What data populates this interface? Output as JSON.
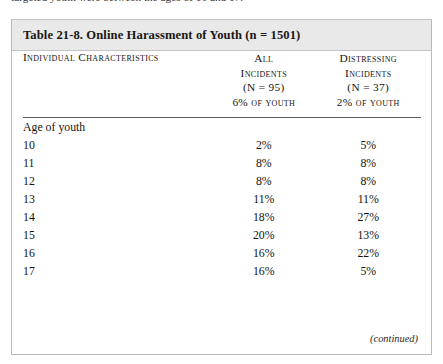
{
  "page": {
    "running_text_tail": "targeted youth were between the ages of 10 and 17."
  },
  "table": {
    "caption": "Table 21-8. Online Harassment of Youth (n = 1501)",
    "footer_note": "(continued)",
    "columns": [
      {
        "key": "characteristics",
        "header_lines": [
          "Individual Characteristics"
        ],
        "align": "left"
      },
      {
        "key": "all_incidents",
        "header_lines": [
          "All",
          "Incidents",
          "(N = 95)"
        ],
        "header_pct_lead": "6%",
        "header_pct_rest": " of youth",
        "align": "center"
      },
      {
        "key": "distressing_incidents",
        "header_lines": [
          "Distressing",
          "Incidents",
          "(N = 37)"
        ],
        "header_pct_lead": "2%",
        "header_pct_rest": " of youth",
        "align": "center"
      }
    ],
    "groups": [
      {
        "label": "Age of youth",
        "rows": [
          {
            "label": "10",
            "all_incidents": "2%",
            "distressing_incidents": "5%"
          },
          {
            "label": "11",
            "all_incidents": "8%",
            "distressing_incidents": "8%"
          },
          {
            "label": "12",
            "all_incidents": "8%",
            "distressing_incidents": "8%"
          },
          {
            "label": "13",
            "all_incidents": "11%",
            "distressing_incidents": "11%"
          },
          {
            "label": "14",
            "all_incidents": "18%",
            "distressing_incidents": "27%"
          },
          {
            "label": "15",
            "all_incidents": "20%",
            "distressing_incidents": "13%"
          },
          {
            "label": "16",
            "all_incidents": "16%",
            "distressing_incidents": "22%"
          },
          {
            "label": "17",
            "all_incidents": "16%",
            "distressing_incidents": "5%"
          }
        ]
      }
    ]
  },
  "colors": {
    "caption_band": "#e9e9e9",
    "table_border": "#b9b9b9",
    "header_rule": "#5c5a55",
    "text": "#15140f",
    "page_background": "#ffffff"
  }
}
